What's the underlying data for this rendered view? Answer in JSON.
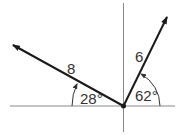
{
  "diagram": {
    "type": "vector-diagram",
    "colors": {
      "axis": "#888888",
      "vector": "#1a1a1a",
      "label": "#333333",
      "background": "#ffffff"
    },
    "vectors": [
      {
        "id": "v1",
        "magnitude_label": "8",
        "angle_label": "28°",
        "angle_deg": 28,
        "direction": "upper-left",
        "measured_from": "negative x-axis"
      },
      {
        "id": "v2",
        "magnitude_label": "6",
        "angle_label": "62°",
        "angle_deg": 62,
        "direction": "upper-right",
        "measured_from": "positive x-axis"
      }
    ]
  }
}
